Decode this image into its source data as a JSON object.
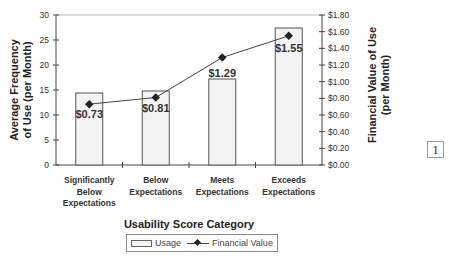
{
  "chart_data": {
    "type": "bar+line",
    "title": "",
    "xlabel": "Usability Score Category",
    "ylabel": "Average Frequency of Use (per Month)",
    "ylabel_lines": [
      "Average Frequency",
      "of Use  (per Month)"
    ],
    "y2label": "Financial Value of Use (per Month)",
    "y2label_lines": [
      "Financial Value of Use",
      "(per Month)"
    ],
    "categories": [
      [
        "Significantly",
        "Below",
        "Expectations"
      ],
      [
        "Below",
        "Expectations"
      ],
      [
        "Meets",
        "Expectations"
      ],
      [
        "Exceeds",
        "Expectations"
      ]
    ],
    "series": [
      {
        "name": "Usage",
        "type": "bar",
        "axis": "left",
        "values": [
          14.4,
          14.8,
          17.2,
          27.4
        ]
      },
      {
        "name": "Financial Value",
        "type": "line",
        "axis": "right",
        "values": [
          0.73,
          0.81,
          1.29,
          1.55
        ],
        "data_labels": [
          "$0.73",
          "$0.81",
          "$1.29",
          "$1.55"
        ]
      }
    ],
    "ylim": [
      0,
      30
    ],
    "yticks": [
      "0",
      "5",
      "10",
      "15",
      "20",
      "25",
      "30"
    ],
    "y2lim": [
      0,
      1.8
    ],
    "y2ticks": [
      "$0.00",
      "$0.20",
      "$0.40",
      "$0.60",
      "$0.80",
      "$1.00",
      "$1.20",
      "$1.40",
      "$1.60",
      "$1.80"
    ],
    "grid": false,
    "legend_position": "bottom",
    "legend": [
      "Usage",
      "Financial Value"
    ]
  },
  "page_number": "1"
}
